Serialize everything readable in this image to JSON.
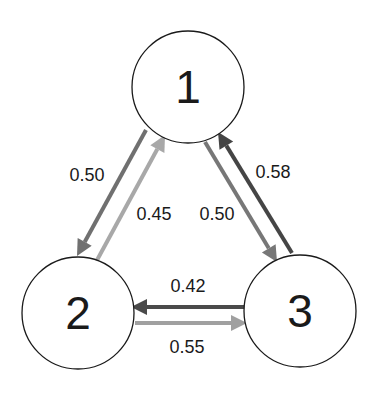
{
  "diagram": {
    "type": "markov-chain",
    "nodes": [
      {
        "id": "1",
        "label": "1",
        "cx": 188,
        "cy": 87,
        "r": 56
      },
      {
        "id": "2",
        "label": "2",
        "cx": 78,
        "cy": 313,
        "r": 56
      },
      {
        "id": "3",
        "label": "3",
        "cx": 300,
        "cy": 311,
        "r": 56
      }
    ],
    "edges": [
      {
        "from": "1",
        "to": "2",
        "label": "0.50",
        "color": "#707070",
        "x1": 146,
        "y1": 130,
        "x2": 77,
        "y2": 256,
        "lx": 87,
        "ly": 181
      },
      {
        "from": "2",
        "to": "1",
        "label": "0.45",
        "color": "#a8a8a8",
        "x1": 96,
        "y1": 262,
        "x2": 165,
        "y2": 135,
        "lx": 154,
        "ly": 220
      },
      {
        "from": "1",
        "to": "3",
        "label": "0.50",
        "color": "#777777",
        "x1": 205,
        "y1": 142,
        "x2": 277,
        "y2": 262,
        "lx": 217,
        "ly": 220
      },
      {
        "from": "3",
        "to": "1",
        "label": "0.58",
        "color": "#454545",
        "x1": 292,
        "y1": 253,
        "x2": 218,
        "y2": 132,
        "lx": 273,
        "ly": 178
      },
      {
        "from": "3",
        "to": "2",
        "label": "0.42",
        "color": "#4a4a4a",
        "x1": 246,
        "y1": 307,
        "x2": 131,
        "y2": 307,
        "lx": 188,
        "ly": 292
      },
      {
        "from": "2",
        "to": "3",
        "label": "0.55",
        "color": "#a0a0a0",
        "x1": 135,
        "y1": 323,
        "x2": 247,
        "y2": 323,
        "lx": 187,
        "ly": 353
      }
    ]
  }
}
